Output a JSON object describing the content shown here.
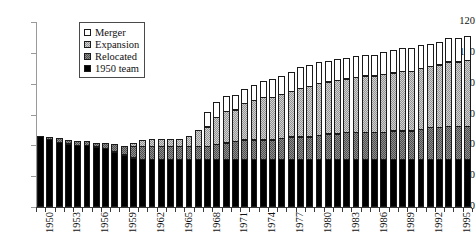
{
  "chart_data": {
    "type": "bar",
    "subtype": "stacked",
    "title": "",
    "xlabel": "",
    "ylabel": "",
    "ylim": [
      0,
      120
    ],
    "ytick_step": 20,
    "yticks": [
      0,
      20,
      40,
      60,
      80,
      100,
      120
    ],
    "grid": false,
    "legend_position": "upper-left-inside",
    "x_tick_label_rotation": 90,
    "x_label_every_n": 3,
    "categories": [
      "1950",
      "1951",
      "1952",
      "1953",
      "1954",
      "1955",
      "1956",
      "1957",
      "1958",
      "1959",
      "1960",
      "1961",
      "1962",
      "1963",
      "1964",
      "1965",
      "1966",
      "1967",
      "1968",
      "1969",
      "1970",
      "1971",
      "1972",
      "1973",
      "1974",
      "1975",
      "1976",
      "1977",
      "1978",
      "1979",
      "1980",
      "1981",
      "1982",
      "1983",
      "1984",
      "1985",
      "1986",
      "1987",
      "1988",
      "1989",
      "1990",
      "1991",
      "1992",
      "1993",
      "1994",
      "1995",
      "1996"
    ],
    "visible_x_tick_labels": [
      "1950",
      "1953",
      "1956",
      "1959",
      "1962",
      "1965",
      "1968",
      "1971",
      "1974",
      "1977",
      "1980",
      "1983",
      "1986",
      "1989",
      "1992",
      "1995"
    ],
    "series": [
      {
        "name": "1950 team",
        "color": "#000000",
        "values": [
          46,
          44,
          42,
          41,
          40,
          40,
          39,
          38,
          36,
          34,
          32,
          31,
          31,
          31,
          31,
          31,
          31,
          31,
          31,
          31,
          31,
          31,
          31,
          31,
          31,
          31,
          31,
          31,
          31,
          31,
          31,
          31,
          31,
          31,
          31,
          31,
          31,
          31,
          31,
          31,
          31,
          31,
          31,
          31,
          31,
          31,
          31
        ]
      },
      {
        "name": "Relocated",
        "color": "#8f8f8f",
        "values": [
          0,
          2,
          3,
          3,
          3,
          3,
          3,
          4,
          5,
          6,
          8,
          9,
          9,
          9,
          9,
          9,
          9,
          9,
          9,
          10,
          11,
          12,
          13,
          13,
          13,
          13,
          14,
          15,
          15,
          15,
          16,
          17,
          17,
          18,
          18,
          18,
          18,
          18,
          19,
          19,
          19,
          20,
          21,
          21,
          22,
          22,
          22
        ]
      },
      {
        "name": "Expansion",
        "color": "#d2d2d2",
        "values": [
          0,
          0,
          0,
          0,
          0,
          0,
          0,
          0,
          0,
          0,
          2,
          4,
          5,
          5,
          5,
          5,
          7,
          11,
          13,
          18,
          21,
          21,
          24,
          26,
          28,
          28,
          29,
          30,
          32,
          33,
          34,
          34,
          35,
          35,
          36,
          37,
          37,
          38,
          38,
          39,
          39,
          40,
          40,
          41,
          42,
          42,
          43
        ]
      },
      {
        "name": "Merger",
        "color": "#ffffff",
        "values": [
          0,
          0,
          0,
          0,
          0,
          0,
          0,
          0,
          0,
          0,
          0,
          0,
          0,
          0,
          0,
          0,
          0,
          0,
          10,
          10,
          10,
          10,
          10,
          10,
          11,
          12,
          12,
          13,
          14,
          14,
          14,
          14,
          14,
          14,
          14,
          14,
          14,
          15,
          15,
          15,
          15,
          15,
          15,
          15,
          16,
          16,
          16
        ]
      }
    ],
    "totals": [
      46,
      46,
      45,
      44,
      43,
      43,
      42,
      42,
      41,
      40,
      42,
      44,
      45,
      45,
      45,
      45,
      47,
      51,
      63,
      69,
      73,
      74,
      78,
      80,
      83,
      84,
      86,
      89,
      92,
      93,
      95,
      96,
      97,
      98,
      99,
      100,
      100,
      102,
      103,
      104,
      104,
      106,
      107,
      108,
      111,
      111,
      112
    ]
  },
  "legend": {
    "items": [
      {
        "label": "Merger",
        "swatch": "merger-swatch"
      },
      {
        "label": "Expansion",
        "swatch": "expansion-swatch"
      },
      {
        "label": "Relocated",
        "swatch": "relocated-swatch"
      },
      {
        "label": "1950 team",
        "swatch": "team-swatch"
      }
    ]
  },
  "axes": {
    "y_tick_labels": [
      "120",
      "100",
      "80",
      "60",
      "40",
      "20",
      "0"
    ]
  }
}
